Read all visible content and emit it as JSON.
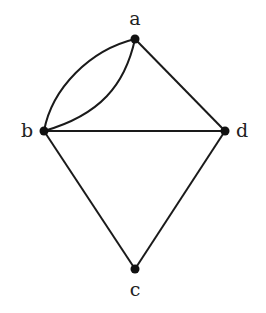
{
  "graph": {
    "nodes": [
      {
        "id": "a",
        "label": "a",
        "x": 135,
        "y": 39
      },
      {
        "id": "b",
        "label": "b",
        "x": 44,
        "y": 131
      },
      {
        "id": "c",
        "label": "c",
        "x": 135,
        "y": 269
      },
      {
        "id": "d",
        "label": "d",
        "x": 225,
        "y": 131
      }
    ],
    "edges": [
      {
        "from": "a",
        "to": "b",
        "type": "curve-outer"
      },
      {
        "from": "a",
        "to": "b",
        "type": "curve-inner"
      },
      {
        "from": "a",
        "to": "d",
        "type": "straight"
      },
      {
        "from": "b",
        "to": "d",
        "type": "straight"
      },
      {
        "from": "b",
        "to": "c",
        "type": "straight"
      },
      {
        "from": "d",
        "to": "c",
        "type": "straight"
      }
    ]
  },
  "labels": {
    "a": "a",
    "b": "b",
    "c": "c",
    "d": "d"
  }
}
